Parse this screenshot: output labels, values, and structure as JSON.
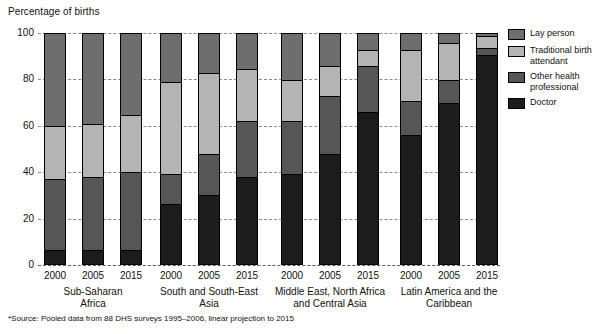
{
  "axis_title": "Percentage of births",
  "footnote": "*Source: Pooled data from 88 DHS surveys 1995–2006, linear projection to 2015",
  "legend": {
    "items": [
      {
        "label": "Lay person",
        "color": "#6e6e6e",
        "key": "lay"
      },
      {
        "label": "Traditional birth attendant",
        "color": "#b4b4b4",
        "key": "tba"
      },
      {
        "label": "Other health professional",
        "color": "#565656",
        "key": "oth"
      },
      {
        "label": "Doctor",
        "color": "#1c1c1c",
        "key": "doc"
      }
    ]
  },
  "chart_data": {
    "type": "bar",
    "subtype": "stacked-bar-100",
    "title": "",
    "ylabel": "Percentage of births",
    "xlabel": "",
    "ylim": [
      0,
      100
    ],
    "yticks": [
      0,
      20,
      40,
      60,
      80,
      100
    ],
    "grid": true,
    "legend_position": "right",
    "categories": [
      "2000",
      "2005",
      "2015"
    ],
    "groups": [
      {
        "name": "Sub-Saharan Africa",
        "name_lines": [
          "Sub-Saharan",
          "Africa"
        ],
        "bars": [
          {
            "year": "2000",
            "doctor": 6,
            "other_health_professional": 31,
            "traditional_birth_attendant": 23,
            "lay_person": 40
          },
          {
            "year": "2005",
            "doctor": 6,
            "other_health_professional": 32,
            "traditional_birth_attendant": 23,
            "lay_person": 39
          },
          {
            "year": "2015",
            "doctor": 6,
            "other_health_professional": 34,
            "traditional_birth_attendant": 25,
            "lay_person": 35
          }
        ]
      },
      {
        "name": "South and South-East Asia",
        "name_lines": [
          "South and South-East",
          "Asia"
        ],
        "bars": [
          {
            "year": "2000",
            "doctor": 26,
            "other_health_professional": 13,
            "traditional_birth_attendant": 40,
            "lay_person": 21
          },
          {
            "year": "2005",
            "doctor": 30,
            "other_health_professional": 18,
            "traditional_birth_attendant": 35,
            "lay_person": 17
          },
          {
            "year": "2015",
            "doctor": 38,
            "other_health_professional": 24,
            "traditional_birth_attendant": 23,
            "lay_person": 15
          }
        ]
      },
      {
        "name": "Middle East, North Africa and Central Asia",
        "name_lines": [
          "Middle East, North Africa",
          "and Central Asia"
        ],
        "bars": [
          {
            "year": "2000",
            "doctor": 39,
            "other_health_professional": 23,
            "traditional_birth_attendant": 18,
            "lay_person": 20
          },
          {
            "year": "2005",
            "doctor": 48,
            "other_health_professional": 25,
            "traditional_birth_attendant": 13,
            "lay_person": 14
          },
          {
            "year": "2015",
            "doctor": 66,
            "other_health_professional": 20,
            "traditional_birth_attendant": 7,
            "lay_person": 7
          }
        ]
      },
      {
        "name": "Latin America and the Caribbean",
        "name_lines": [
          "Latin America and the",
          "Caribbean"
        ],
        "bars": [
          {
            "year": "2000",
            "doctor": 56,
            "other_health_professional": 15,
            "traditional_birth_attendant": 22,
            "lay_person": 7
          },
          {
            "year": "2005",
            "doctor": 70,
            "other_health_professional": 10,
            "traditional_birth_attendant": 16,
            "lay_person": 4
          },
          {
            "year": "2015",
            "doctor": 91,
            "other_health_professional": 3,
            "traditional_birth_attendant": 5,
            "lay_person": 1
          }
        ]
      }
    ]
  }
}
